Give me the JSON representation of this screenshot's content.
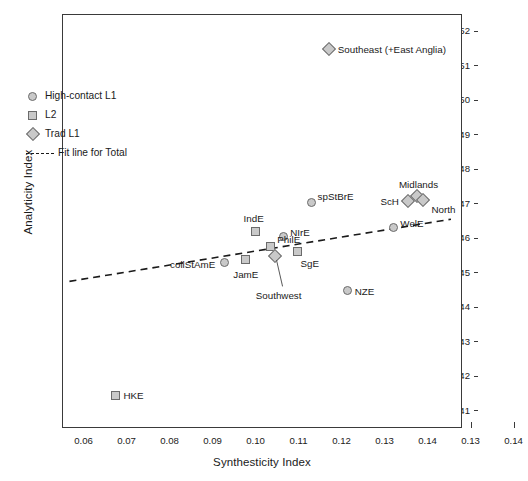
{
  "chart_data": {
    "type": "scatter",
    "title": "",
    "xlabel": "Synthesticity Index",
    "ylabel": "Analyticity Index",
    "xlim": [
      0.055,
      0.148
    ],
    "ylim": [
      0.405,
      0.525
    ],
    "grid": false,
    "legend_position": "upper-left",
    "x_tick_labels": [
      "0.06",
      "0.07",
      "0.08",
      "0.09",
      "0.10",
      "0.11",
      "0.12",
      "0.13",
      "0.14",
      "0.13",
      "0.14"
    ],
    "x_tick_values": [
      0.06,
      0.07,
      0.08,
      0.09,
      0.1,
      0.11,
      0.12,
      0.13,
      0.14,
      0.15,
      0.16
    ],
    "y_tick_labels": [
      "0.52",
      "0.51",
      "0.50",
      "0.49",
      "0.48",
      "0.47",
      "0.46",
      "0.45",
      "0.44",
      "0.43",
      "0.42",
      "0.41"
    ],
    "y_tick_values": [
      0.52,
      0.51,
      0.5,
      0.49,
      0.48,
      0.47,
      0.46,
      0.45,
      0.44,
      0.43,
      0.42,
      0.41
    ],
    "series": [
      {
        "name": "High-contact L1",
        "marker": "circle",
        "points": [
          {
            "label": "collStAmE",
            "x": 0.0925,
            "y": 0.4532
          },
          {
            "label": "NIrE",
            "x": 0.1062,
            "y": 0.4608
          },
          {
            "label": "spStBrE",
            "x": 0.1128,
            "y": 0.4707
          },
          {
            "label": "WelE",
            "x": 0.1318,
            "y": 0.4635
          },
          {
            "label": "NZE",
            "x": 0.1212,
            "y": 0.4452
          }
        ]
      },
      {
        "name": "L2",
        "marker": "square",
        "points": [
          {
            "label": "HKE",
            "x": 0.0672,
            "y": 0.4148
          },
          {
            "label": "JamE",
            "x": 0.0975,
            "y": 0.454
          },
          {
            "label": "IndE",
            "x": 0.0998,
            "y": 0.4622
          },
          {
            "label": "PhilE",
            "x": 0.1032,
            "y": 0.458
          },
          {
            "label": "SgE",
            "x": 0.1095,
            "y": 0.4565
          }
        ]
      },
      {
        "name": "Trad L1",
        "marker": "diamond",
        "points": [
          {
            "label": "Southwest",
            "x": 0.1042,
            "y": 0.4552
          },
          {
            "label": "Southeast (+East Anglia)",
            "x": 0.1168,
            "y": 0.5152
          },
          {
            "label": "ScH",
            "x": 0.1352,
            "y": 0.4712
          },
          {
            "label": "Midlands",
            "x": 0.1372,
            "y": 0.4725
          },
          {
            "label": "North",
            "x": 0.1388,
            "y": 0.4715
          }
        ]
      }
    ],
    "fit_line": {
      "label": "Fit line for Total",
      "style": "dashed",
      "x_start": 0.0565,
      "y_start": 0.4478,
      "x_end": 0.1452,
      "y_end": 0.4658
    }
  },
  "legend": {
    "items": [
      {
        "label": "High-contact L1",
        "marker": "circle"
      },
      {
        "label": "L2",
        "marker": "square"
      },
      {
        "label": "Trad L1",
        "marker": "diamond"
      },
      {
        "label": "Fit line for Total",
        "marker": "dashline"
      }
    ]
  }
}
